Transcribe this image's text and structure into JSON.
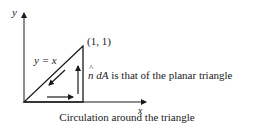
{
  "figure": {
    "axes": {
      "x_label": "x",
      "y_label": "y"
    },
    "triangle": {
      "vertex_label": "(1, 1)",
      "hypotenuse_label": "y = x"
    },
    "annotation": {
      "normal_symbol": "n",
      "normal_rest": " dA",
      "text": " is that of the planar triangle"
    },
    "caption": "Circulation around the triangle",
    "colors": {
      "stroke": "#1a1a1a",
      "background": "#ffffff"
    }
  }
}
